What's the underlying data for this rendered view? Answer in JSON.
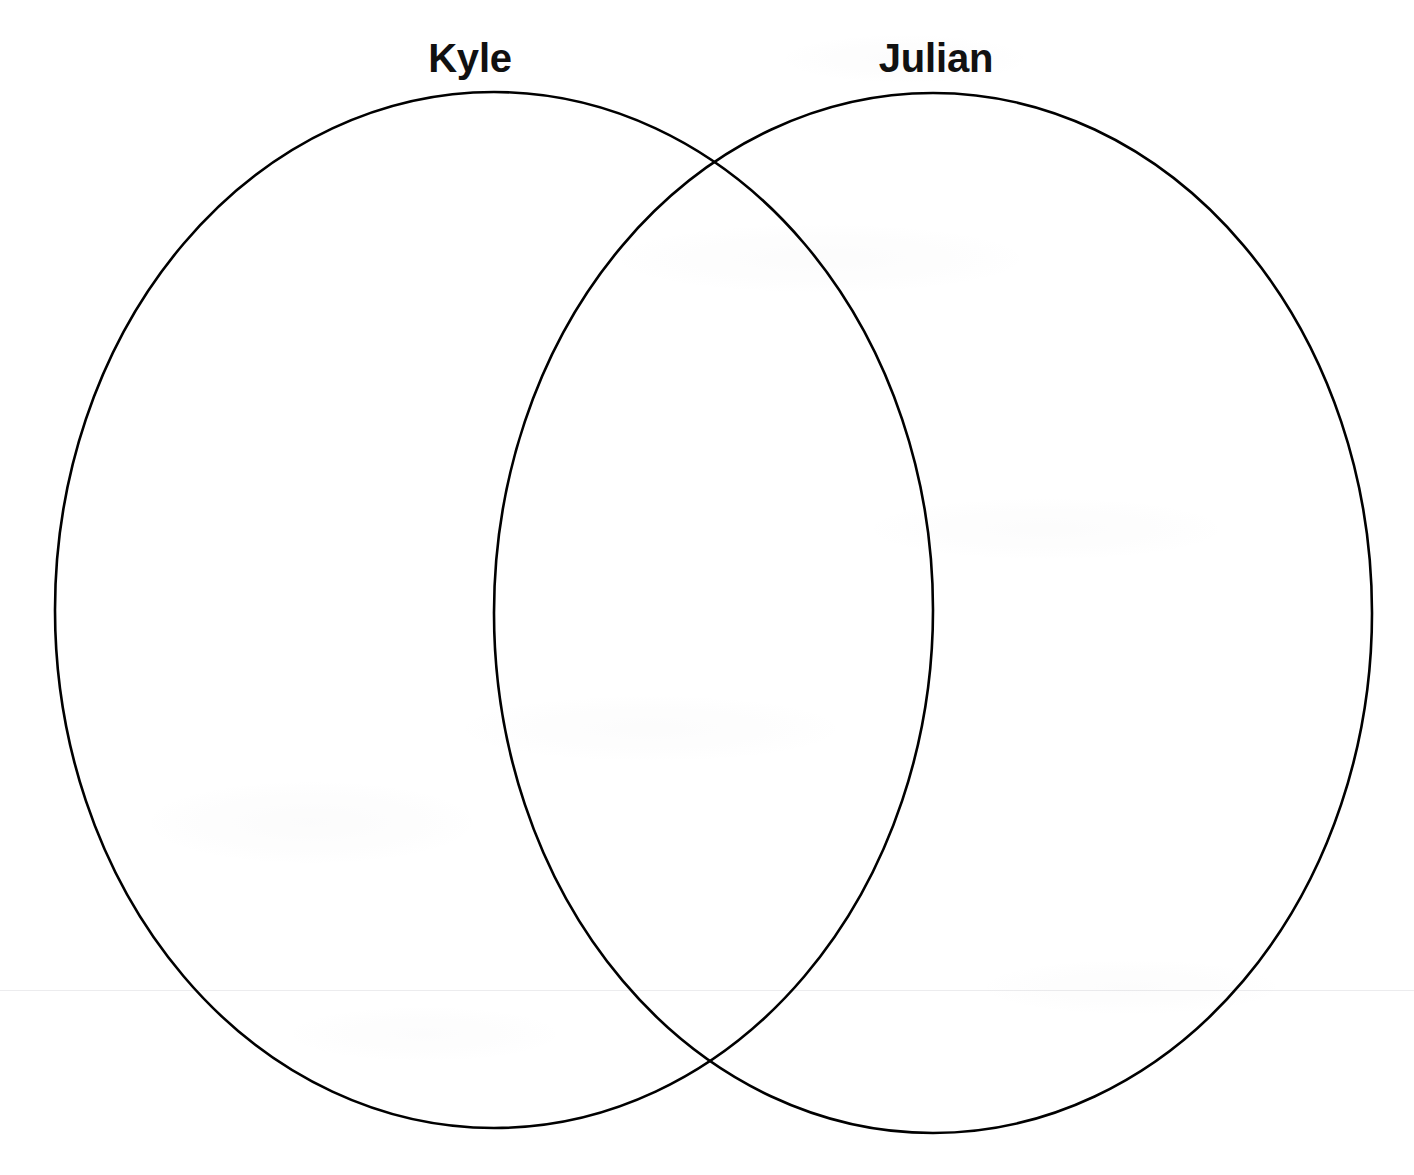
{
  "document": {
    "type": "venn-diagram-worksheet",
    "title": "",
    "background_color": "#ffffff",
    "stroke_color": "#000000",
    "label_color": "#111111",
    "width": 1414,
    "height": 1175
  },
  "diagram": {
    "kind": "venn",
    "set_count": 2,
    "regions_filled": false,
    "region_text": {
      "left_only": "",
      "overlap": "",
      "right_only": ""
    },
    "sets": [
      {
        "id": "left",
        "label": "Kyle",
        "label_center_x": 470,
        "label_top_y": 38,
        "center_x": 494,
        "center_y": 610,
        "radius_x": 439,
        "radius_y": 518,
        "stroke_width": 2.6,
        "fill": "none"
      },
      {
        "id": "right",
        "label": "Julian",
        "label_center_x": 936,
        "label_top_y": 38,
        "center_x": 933,
        "center_y": 613,
        "radius_x": 439,
        "radius_y": 520,
        "stroke_width": 2.6,
        "fill": "none"
      }
    ],
    "intersection_points": [
      {
        "x": 714,
        "y": 163
      },
      {
        "x": 710,
        "y": 1062
      }
    ]
  }
}
